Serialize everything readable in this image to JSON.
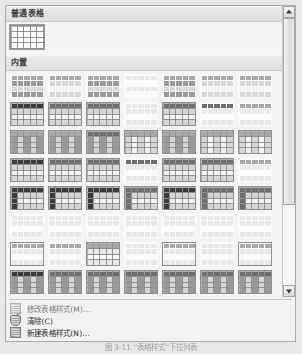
{
  "panel": {
    "name": "table-styles-gallery"
  },
  "sections": [
    {
      "id": "plain",
      "title": "普通表格",
      "columns": 7,
      "styles": [
        {
          "name": "普通表格",
          "bordered": true,
          "selected": true,
          "header": "none",
          "firstcol": "none",
          "banding": "none",
          "grid": true,
          "rows": 4,
          "cols": 5
        }
      ]
    },
    {
      "id": "builtin",
      "title": "内置",
      "columns": 7,
      "styles": [
        {
          "name": "网格型",
          "bordered": false,
          "header": "light",
          "firstcol": "none",
          "banding": "dark-rows",
          "grid": false,
          "rows": 4,
          "cols": 5
        },
        {
          "name": "网格型 1",
          "bordered": false,
          "header": "light",
          "firstcol": "none",
          "banding": "light-rows",
          "grid": false,
          "rows": 4,
          "cols": 5
        },
        {
          "name": "网格型 2",
          "bordered": false,
          "header": "light",
          "firstcol": "none",
          "banding": "dark-rows",
          "grid": false,
          "rows": 4,
          "cols": 5
        },
        {
          "name": "网格型 3",
          "bordered": false,
          "header": "none",
          "firstcol": "none",
          "banding": "faint",
          "grid": false,
          "rows": 4,
          "cols": 5
        },
        {
          "name": "网格型 4",
          "bordered": false,
          "header": "light",
          "firstcol": "none",
          "banding": "dark-rows",
          "grid": false,
          "rows": 4,
          "cols": 5
        },
        {
          "name": "网格型 5",
          "bordered": false,
          "header": "light",
          "firstcol": "none",
          "banding": "light-rows",
          "grid": false,
          "rows": 4,
          "cols": 5
        },
        {
          "name": "网格型 6",
          "bordered": false,
          "header": "light",
          "firstcol": "none",
          "banding": "light-rows",
          "grid": false,
          "rows": 4,
          "cols": 5
        },
        {
          "name": "列表型",
          "bordered": true,
          "header": "dark",
          "firstcol": "none",
          "banding": "light-rows",
          "grid": true,
          "rows": 4,
          "cols": 5
        },
        {
          "name": "列表型 1",
          "bordered": true,
          "header": "mid",
          "firstcol": "none",
          "banding": "light-rows",
          "grid": true,
          "rows": 4,
          "cols": 5
        },
        {
          "name": "列表型 2",
          "bordered": true,
          "header": "mid",
          "firstcol": "none",
          "banding": "light-rows",
          "grid": true,
          "rows": 4,
          "cols": 5
        },
        {
          "name": "列表型 3",
          "bordered": false,
          "header": "faint",
          "firstcol": "none",
          "banding": "faint",
          "grid": false,
          "rows": 4,
          "cols": 5
        },
        {
          "name": "列表型 4",
          "bordered": true,
          "header": "mid",
          "firstcol": "none",
          "banding": "light-rows",
          "grid": true,
          "rows": 4,
          "cols": 5
        },
        {
          "name": "列表型 5",
          "bordered": false,
          "header": "mid",
          "firstcol": "none",
          "banding": "faint",
          "grid": false,
          "rows": 4,
          "cols": 5
        },
        {
          "name": "列表型 6",
          "bordered": false,
          "header": "light",
          "firstcol": "none",
          "banding": "faint",
          "grid": false,
          "rows": 4,
          "cols": 5
        },
        {
          "name": "竖列型",
          "bordered": true,
          "header": "light",
          "firstcol": "none",
          "banding": "dark-cols",
          "grid": true,
          "rows": 4,
          "cols": 5
        },
        {
          "name": "竖列型 1",
          "bordered": true,
          "header": "light",
          "firstcol": "none",
          "banding": "dark-cols",
          "grid": true,
          "rows": 4,
          "cols": 5
        },
        {
          "name": "竖列型 2",
          "bordered": true,
          "header": "mid",
          "firstcol": "none",
          "banding": "dark-cols",
          "grid": true,
          "rows": 4,
          "cols": 5
        },
        {
          "name": "竖列型 3",
          "bordered": true,
          "header": "light",
          "firstcol": "none",
          "banding": "light-cols",
          "grid": true,
          "rows": 4,
          "cols": 5
        },
        {
          "name": "竖列型 4",
          "bordered": true,
          "header": "light",
          "firstcol": "none",
          "banding": "dark-cols",
          "grid": true,
          "rows": 4,
          "cols": 5
        },
        {
          "name": "竖列型 5",
          "bordered": true,
          "header": "light",
          "firstcol": "none",
          "banding": "light-cols",
          "grid": true,
          "rows": 4,
          "cols": 5
        },
        {
          "name": "竖列型 6",
          "bordered": true,
          "header": "light",
          "firstcol": "none",
          "banding": "light-cols",
          "grid": true,
          "rows": 4,
          "cols": 5
        },
        {
          "name": "彩色型",
          "bordered": true,
          "header": "dark",
          "firstcol": "none",
          "banding": "light-rows",
          "grid": true,
          "rows": 4,
          "cols": 5
        },
        {
          "name": "彩色型 1",
          "bordered": true,
          "header": "mid",
          "firstcol": "none",
          "banding": "light-rows",
          "grid": true,
          "rows": 4,
          "cols": 5
        },
        {
          "name": "彩色型 2",
          "bordered": true,
          "header": "mid",
          "firstcol": "none",
          "banding": "light-rows",
          "grid": true,
          "rows": 4,
          "cols": 5
        },
        {
          "name": "彩色型 3",
          "bordered": false,
          "header": "mid",
          "firstcol": "none",
          "banding": "faint",
          "grid": false,
          "rows": 4,
          "cols": 5
        },
        {
          "name": "彩色型 4",
          "bordered": true,
          "header": "mid",
          "firstcol": "none",
          "banding": "light-rows",
          "grid": true,
          "rows": 4,
          "cols": 5
        },
        {
          "name": "彩色型 5",
          "bordered": true,
          "header": "mid",
          "firstcol": "none",
          "banding": "light-rows",
          "grid": true,
          "rows": 4,
          "cols": 5
        },
        {
          "name": "彩色型 6",
          "bordered": false,
          "header": "light",
          "firstcol": "none",
          "banding": "faint",
          "grid": false,
          "rows": 4,
          "cols": 5
        },
        {
          "name": "专业型",
          "bordered": true,
          "header": "dark",
          "firstcol": "dark",
          "banding": "light-rows",
          "grid": true,
          "rows": 4,
          "cols": 5
        },
        {
          "name": "专业型 1",
          "bordered": true,
          "header": "dark",
          "firstcol": "dark",
          "banding": "light-rows",
          "grid": true,
          "rows": 4,
          "cols": 5
        },
        {
          "name": "专业型 2",
          "bordered": true,
          "header": "dark",
          "firstcol": "dark",
          "banding": "light-rows",
          "grid": true,
          "rows": 4,
          "cols": 5
        },
        {
          "name": "专业型 3",
          "bordered": true,
          "header": "mid",
          "firstcol": "mid",
          "banding": "light-rows",
          "grid": true,
          "rows": 4,
          "cols": 5
        },
        {
          "name": "专业型 4",
          "bordered": true,
          "header": "dark",
          "firstcol": "dark",
          "banding": "light-rows",
          "grid": true,
          "rows": 4,
          "cols": 5
        },
        {
          "name": "专业型 5",
          "bordered": true,
          "header": "mid",
          "firstcol": "mid",
          "banding": "light-rows",
          "grid": true,
          "rows": 4,
          "cols": 5
        },
        {
          "name": "专业型 6",
          "bordered": true,
          "header": "mid",
          "firstcol": "mid",
          "banding": "light-rows",
          "grid": true,
          "rows": 4,
          "cols": 5
        },
        {
          "name": "简明型",
          "bordered": false,
          "header": "faint",
          "firstcol": "none",
          "banding": "faint",
          "grid": false,
          "rows": 4,
          "cols": 5
        },
        {
          "name": "简明型 1",
          "bordered": false,
          "header": "faint",
          "firstcol": "none",
          "banding": "faint",
          "grid": false,
          "rows": 4,
          "cols": 5
        },
        {
          "name": "简明型 2",
          "bordered": false,
          "header": "faint",
          "firstcol": "none",
          "banding": "faint",
          "grid": false,
          "rows": 4,
          "cols": 5
        },
        {
          "name": "简明型 3",
          "bordered": false,
          "header": "faint",
          "firstcol": "none",
          "banding": "faint",
          "grid": false,
          "rows": 4,
          "cols": 5
        },
        {
          "name": "简明型 4",
          "bordered": false,
          "header": "faint",
          "firstcol": "none",
          "banding": "faint",
          "grid": false,
          "rows": 4,
          "cols": 5
        },
        {
          "name": "简明型 5",
          "bordered": false,
          "header": "faint",
          "firstcol": "none",
          "banding": "faint",
          "grid": false,
          "rows": 4,
          "cols": 5
        },
        {
          "name": "简明型 6",
          "bordered": false,
          "header": "faint",
          "firstcol": "none",
          "banding": "faint",
          "grid": false,
          "rows": 4,
          "cols": 5
        },
        {
          "name": "流行型",
          "bordered": true,
          "header": "light",
          "firstcol": "none",
          "banding": "faint",
          "grid": false,
          "rows": 4,
          "cols": 5
        },
        {
          "name": "流行型 1",
          "bordered": false,
          "header": "light",
          "firstcol": "none",
          "banding": "faint",
          "grid": false,
          "rows": 4,
          "cols": 5
        },
        {
          "name": "流行型 2",
          "bordered": true,
          "header": "light",
          "firstcol": "none",
          "banding": "faint",
          "grid": true,
          "rows": 4,
          "cols": 5
        },
        {
          "name": "流行型 3",
          "bordered": false,
          "header": "faint",
          "firstcol": "none",
          "banding": "faint",
          "grid": false,
          "rows": 4,
          "cols": 5
        },
        {
          "name": "流行型 4",
          "bordered": true,
          "header": "light",
          "firstcol": "none",
          "banding": "faint",
          "grid": false,
          "rows": 4,
          "cols": 5
        },
        {
          "name": "流行型 5",
          "bordered": false,
          "header": "faint",
          "firstcol": "none",
          "banding": "faint",
          "grid": false,
          "rows": 4,
          "cols": 5
        },
        {
          "name": "流行型 6",
          "bordered": true,
          "header": "light",
          "firstcol": "none",
          "banding": "faint",
          "grid": false,
          "rows": 4,
          "cols": 5
        },
        {
          "name": "典雅型",
          "bordered": true,
          "header": "dark",
          "firstcol": "none",
          "banding": "dark-cols",
          "grid": true,
          "rows": 4,
          "cols": 5
        },
        {
          "name": "典雅型 1",
          "bordered": true,
          "header": "mid",
          "firstcol": "none",
          "banding": "dark-cols",
          "grid": true,
          "rows": 4,
          "cols": 5
        },
        {
          "name": "典雅型 2",
          "bordered": true,
          "header": "mid",
          "firstcol": "none",
          "banding": "dark-cols",
          "grid": true,
          "rows": 4,
          "cols": 5
        },
        {
          "name": "典雅型 3",
          "bordered": true,
          "header": "mid",
          "firstcol": "none",
          "banding": "dark-cols",
          "grid": true,
          "rows": 4,
          "cols": 5
        },
        {
          "name": "典雅型 4",
          "bordered": true,
          "header": "mid",
          "firstcol": "none",
          "banding": "dark-cols",
          "grid": true,
          "rows": 4,
          "cols": 5
        },
        {
          "name": "典雅型 5",
          "bordered": true,
          "header": "mid",
          "firstcol": "none",
          "banding": "dark-cols",
          "grid": true,
          "rows": 4,
          "cols": 5
        },
        {
          "name": "典雅型 6",
          "bordered": true,
          "header": "mid",
          "firstcol": "none",
          "banding": "dark-cols",
          "grid": true,
          "rows": 4,
          "cols": 5
        }
      ]
    }
  ],
  "commands": [
    {
      "id": "modify",
      "label": "修改表格样式(M)...",
      "icon": "table-pencil-icon",
      "enabled": false
    },
    {
      "id": "clear",
      "label": "清除(C)",
      "icon": "eraser-icon",
      "enabled": true
    },
    {
      "id": "new",
      "label": "新建表格样式(N)...",
      "icon": "new-table-icon",
      "enabled": true
    }
  ],
  "scrollbar": {
    "up_label": "▲",
    "down_label": "▼",
    "thumb_top_percent": 0,
    "thumb_height_percent": 70
  },
  "caption": {
    "text": "图 3-11  “表格样式”下拉列表"
  },
  "colors": {
    "panel_bg": "#f2f2f0",
    "panel_border": "#a9a9a5",
    "section_header_bg": "#e4e4e2",
    "thumb_border": "#8e8e8a",
    "header_dark": "#3a3a38",
    "header_mid": "#6e6e6a",
    "header_light": "#a8a8a4",
    "band_dark": "#9a9a96",
    "band_light": "#d6d6d2",
    "band_faint": "#e8e8e5"
  }
}
